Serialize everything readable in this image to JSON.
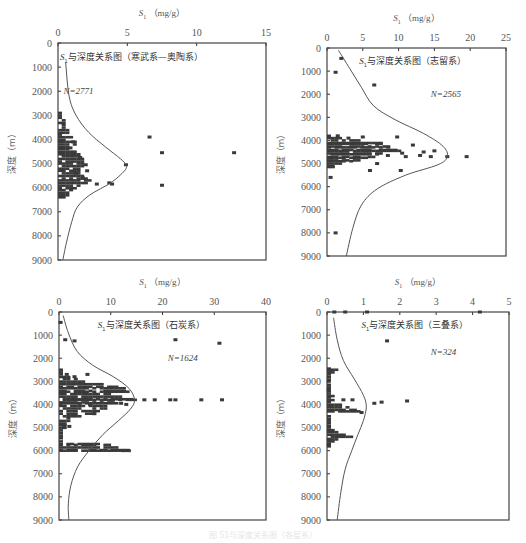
{
  "figure": {
    "caption": "图  S1与深度关系图（各层系）",
    "y_axis_label": "深度（m）",
    "x_axis_title_prefix": "S",
    "x_axis_title_sub": "1",
    "x_axis_title_unit": "（mg/g）"
  },
  "chart_data": [
    {
      "id": "cambrian-ordovician",
      "type": "scatter",
      "title": "S1与深度关系图（寒武系—奥陶系）",
      "title_sub_prefix": "S",
      "title_rest": "与深度关系图（寒武系—奥陶系）",
      "n_label": "N=2771",
      "xlabel": "S1（mg/g）",
      "ylabel": "深度（m）",
      "xlim": [
        0,
        15
      ],
      "ylim": [
        0,
        9000
      ],
      "x_ticks": [
        0,
        5,
        10,
        15
      ],
      "y_ticks": [
        0,
        1000,
        2000,
        3000,
        4000,
        5000,
        6000,
        7000,
        8000,
        9000
      ],
      "y_inverted": true,
      "box": {
        "x0": 58,
        "y0": 43,
        "x1": 266,
        "y1": 260
      },
      "title_pos": {
        "x": 0.15,
        "y": 700
      },
      "n_pos": {
        "x": 0.4,
        "y": 2100
      },
      "envelope_curve": [
        [
          0.55,
          800
        ],
        [
          0.8,
          2200
        ],
        [
          1.3,
          3000
        ],
        [
          2.2,
          3700
        ],
        [
          3.4,
          4300
        ],
        [
          4.5,
          4800
        ],
        [
          4.9,
          5050
        ],
        [
          4.8,
          5300
        ],
        [
          3.8,
          5800
        ],
        [
          2.3,
          6300
        ],
        [
          1.4,
          6800
        ],
        [
          1.0,
          7400
        ],
        [
          0.6,
          8300
        ],
        [
          0.35,
          9000
        ]
      ],
      "dense_band": {
        "x_max": [
          [
            0,
            2900
          ],
          [
            0.2,
            3100
          ],
          [
            0.4,
            3400
          ],
          [
            0.7,
            3800
          ],
          [
            1.2,
            4100
          ],
          [
            1.0,
            4400
          ],
          [
            1.5,
            4700
          ],
          [
            1.8,
            5000
          ],
          [
            1.4,
            5300
          ],
          [
            2.2,
            5700
          ],
          [
            1.0,
            6100
          ],
          [
            0.4,
            6400
          ],
          [
            0,
            6450
          ]
        ]
      },
      "points": [
        [
          6.6,
          3900
        ],
        [
          7.5,
          4550
        ],
        [
          12.7,
          4550
        ],
        [
          4.9,
          5050
        ],
        [
          3.7,
          5800
        ],
        [
          3.9,
          5850
        ],
        [
          7.5,
          5900
        ],
        [
          2.8,
          5850
        ],
        [
          2.1,
          5300
        ],
        [
          1.6,
          4750
        ],
        [
          1.1,
          4100
        ],
        [
          0.9,
          4350
        ],
        [
          1.8,
          5600
        ],
        [
          1.3,
          5400
        ],
        [
          2.0,
          5050
        ]
      ]
    },
    {
      "id": "silurian",
      "type": "scatter",
      "title": "S1与深度关系图（志留系）",
      "title_sub_prefix": "S",
      "title_rest": "与深度关系图（志留系）",
      "n_label": "N=2565",
      "xlabel": "S1（mg/g）",
      "ylabel": "深度（m）",
      "xlim": [
        0,
        25
      ],
      "ylim": [
        0,
        9000
      ],
      "x_ticks": [
        0,
        5,
        10,
        15,
        20,
        25
      ],
      "y_ticks": [
        0,
        1000,
        2000,
        3000,
        4000,
        5000,
        6000,
        7000,
        8000,
        9000
      ],
      "y_inverted": true,
      "box": {
        "x0": 327,
        "y0": 48,
        "x1": 506,
        "y1": 256
      },
      "title_pos": {
        "x": 4.5,
        "y": 700
      },
      "n_pos": {
        "x": 14.5,
        "y": 2100
      },
      "envelope_curve": [
        [
          1.6,
          100
        ],
        [
          3.2,
          900
        ],
        [
          4.8,
          1700
        ],
        [
          6.5,
          2500
        ],
        [
          9.5,
          3100
        ],
        [
          13.5,
          3700
        ],
        [
          16.2,
          4250
        ],
        [
          16.8,
          4700
        ],
        [
          15.5,
          5050
        ],
        [
          11.0,
          5500
        ],
        [
          7.0,
          6100
        ],
        [
          4.8,
          6800
        ],
        [
          3.6,
          7800
        ],
        [
          2.7,
          9000
        ]
      ],
      "dense_band": {
        "x_max": [
          [
            0,
            3800
          ],
          [
            2,
            3900
          ],
          [
            5,
            4000
          ],
          [
            8,
            4150
          ],
          [
            9,
            4300
          ],
          [
            10,
            4450
          ],
          [
            7,
            4600
          ],
          [
            6,
            4750
          ],
          [
            4,
            4900
          ],
          [
            2,
            5000
          ],
          [
            0.6,
            5150
          ],
          [
            0,
            5200
          ]
        ]
      },
      "points": [
        [
          2.0,
          450
        ],
        [
          1.2,
          1050
        ],
        [
          6.6,
          1600
        ],
        [
          16.8,
          4700
        ],
        [
          19.5,
          4700
        ],
        [
          15.0,
          4450
        ],
        [
          13.5,
          4500
        ],
        [
          12.0,
          4200
        ],
        [
          9.8,
          3850
        ],
        [
          13.0,
          4650
        ],
        [
          11.0,
          4700
        ],
        [
          7.0,
          5000
        ],
        [
          10.3,
          5300
        ],
        [
          6.0,
          5300
        ],
        [
          1.2,
          8000
        ],
        [
          0.5,
          5600
        ],
        [
          10.5,
          4550
        ],
        [
          8.5,
          4650
        ],
        [
          14.5,
          4700
        ],
        [
          3.0,
          3900
        ],
        [
          5.0,
          3850
        ],
        [
          1.5,
          3800
        ]
      ]
    },
    {
      "id": "carboniferous",
      "type": "scatter",
      "title": "S1与深度关系图（石炭系）",
      "title_sub_prefix": "S",
      "title_rest": "与深度关系图（石炭系）",
      "n_label": "N=1624",
      "xlabel": "S1（mg/g）",
      "ylabel": "深度（m）",
      "xlim": [
        0,
        40
      ],
      "ylim": [
        0,
        9000
      ],
      "x_ticks": [
        0,
        10,
        20,
        30,
        40
      ],
      "y_ticks": [
        0,
        1000,
        2000,
        3000,
        4000,
        5000,
        6000,
        7000,
        8000,
        9000
      ],
      "y_inverted": true,
      "box": {
        "x0": 59,
        "y0": 312,
        "x1": 266,
        "y1": 520
      },
      "title_pos": {
        "x": 7.5,
        "y": 700
      },
      "n_pos": {
        "x": 21,
        "y": 2100
      },
      "envelope_curve": [
        [
          0.8,
          150
        ],
        [
          1.8,
          900
        ],
        [
          3.5,
          1700
        ],
        [
          6.5,
          2300
        ],
        [
          10.5,
          2800
        ],
        [
          13.5,
          3300
        ],
        [
          14.6,
          3800
        ],
        [
          13.8,
          4200
        ],
        [
          11.5,
          4700
        ],
        [
          8.5,
          5300
        ],
        [
          5.8,
          6000
        ],
        [
          3.6,
          6700
        ],
        [
          2.3,
          7500
        ],
        [
          1.8,
          8300
        ],
        [
          1.9,
          9000
        ]
      ],
      "dense_band": {
        "x_max": [
          [
            0,
            2500
          ],
          [
            0.5,
            2700
          ],
          [
            3,
            2900
          ],
          [
            12.5,
            3300
          ],
          [
            13,
            3450
          ],
          [
            10,
            3550
          ],
          [
            14.5,
            3800
          ],
          [
            11,
            3950
          ],
          [
            6.5,
            4400
          ],
          [
            2,
            4600
          ],
          [
            0.8,
            4900
          ],
          [
            0.5,
            5600
          ],
          [
            9.5,
            5750
          ],
          [
            13.5,
            6000
          ],
          [
            0,
            6050
          ]
        ]
      },
      "points": [
        [
          22.5,
          1200
        ],
        [
          31.0,
          1350
        ],
        [
          3.0,
          1250
        ],
        [
          1.2,
          1200
        ],
        [
          5.5,
          2700
        ],
        [
          3.0,
          2800
        ],
        [
          1.5,
          2700
        ],
        [
          4.0,
          3100
        ],
        [
          16.5,
          3800
        ],
        [
          18.5,
          3800
        ],
        [
          21.5,
          3800
        ],
        [
          22.5,
          3800
        ],
        [
          27.5,
          3800
        ],
        [
          31.5,
          3800
        ],
        [
          12.0,
          3950
        ],
        [
          13.0,
          4000
        ],
        [
          6.0,
          4000
        ],
        [
          4.0,
          3950
        ],
        [
          6.8,
          4400
        ],
        [
          1.0,
          4950
        ],
        [
          2.0,
          4950
        ],
        [
          12.5,
          6000
        ],
        [
          13.5,
          6000
        ],
        [
          0.3,
          450
        ]
      ]
    },
    {
      "id": "triassic",
      "type": "scatter",
      "title": "S1与深度关系图（三叠系）",
      "title_sub_prefix": "S",
      "title_rest": "与深度关系图（三叠系）",
      "n_label": "N=324",
      "xlabel": "S1（mg/g）",
      "ylabel": "深度（m）",
      "xlim": [
        0,
        5
      ],
      "ylim": [
        0,
        9000
      ],
      "x_ticks": [
        0,
        1,
        2,
        3,
        4,
        5
      ],
      "y_ticks": [
        0,
        1000,
        2000,
        3000,
        4000,
        5000,
        6000,
        7000,
        8000,
        9000
      ],
      "y_inverted": true,
      "box": {
        "x0": 327,
        "y0": 312,
        "x1": 509,
        "y1": 520
      },
      "title_pos": {
        "x": 0.95,
        "y": 700
      },
      "n_pos": {
        "x": 2.85,
        "y": 1850
      },
      "envelope_curve": [
        [
          0.18,
          250
        ],
        [
          0.28,
          1200
        ],
        [
          0.45,
          2100
        ],
        [
          0.75,
          2900
        ],
        [
          1.0,
          3600
        ],
        [
          1.08,
          4100
        ],
        [
          1.0,
          4700
        ],
        [
          0.85,
          5300
        ],
        [
          0.68,
          6000
        ],
        [
          0.5,
          6800
        ],
        [
          0.38,
          7800
        ],
        [
          0.28,
          9000
        ]
      ],
      "dense_band": {
        "x_max": [
          [
            0,
            2450
          ],
          [
            0.25,
            2500
          ],
          [
            0.05,
            2700
          ],
          [
            0,
            3300
          ],
          [
            0.15,
            3700
          ],
          [
            0.2,
            3900
          ],
          [
            0.9,
            4300
          ],
          [
            0.1,
            4400
          ],
          [
            0.1,
            4700
          ],
          [
            0,
            5000
          ],
          [
            0.3,
            5200
          ],
          [
            0.65,
            5400
          ],
          [
            0.2,
            5600
          ],
          [
            0.1,
            5700
          ],
          [
            0,
            5900
          ]
        ]
      },
      "points": [
        [
          1.65,
          1250
        ],
        [
          0.45,
          3800
        ],
        [
          0.7,
          3800
        ],
        [
          1.3,
          3950
        ],
        [
          1.5,
          3900
        ],
        [
          2.2,
          3850
        ],
        [
          0.95,
          4350
        ],
        [
          0.05,
          3000
        ],
        [
          0.05,
          3350
        ],
        [
          0.05,
          5500
        ],
        [
          0.05,
          5750
        ],
        [
          0.2,
          0
        ],
        [
          0.5,
          0
        ],
        [
          1.1,
          0
        ],
        [
          4.2,
          0
        ]
      ]
    }
  ]
}
